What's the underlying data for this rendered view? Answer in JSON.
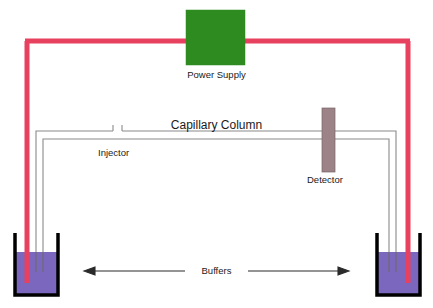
{
  "diagram": {
    "canvas": {
      "width": 433,
      "height": 308,
      "background": "#ffffff"
    },
    "labels": {
      "power_supply": "Power Supply",
      "capillary_column": "Capillary Column",
      "injector": "Injector",
      "detector": "Detector",
      "buffers": "Buffers"
    },
    "components": {
      "power_supply": {
        "name": "power-supply-box",
        "shape": "rectangle",
        "color": "#2E8B20",
        "x": 186,
        "y": 10,
        "width": 59,
        "height": 55
      },
      "detector": {
        "name": "detector-box",
        "shape": "rectangle",
        "color": "#9C8387",
        "x": 322,
        "y": 108,
        "width": 13,
        "height": 64
      },
      "left_beaker": {
        "name": "left-buffer-beaker",
        "wall_color": "#000000",
        "liquid_color": "#7B68BE",
        "x": 12,
        "y": 232,
        "width": 49,
        "height": 66,
        "liquid_top": 252
      },
      "right_beaker": {
        "name": "right-buffer-beaker",
        "wall_color": "#000000",
        "liquid_color": "#7B68BE",
        "x": 372,
        "y": 232,
        "width": 49,
        "height": 66,
        "liquid_top": 252
      },
      "electrode_wire": {
        "name": "high-voltage-wire",
        "color": "#E8415F",
        "stroke_width": 5,
        "description": "Red high-voltage circuit from left beaker electrode up over the power supply and down into the right beaker electrode"
      },
      "capillary": {
        "name": "capillary-tube",
        "color": "#8A8A8A",
        "stroke_width": 1,
        "description": "Gray double-line fused silica capillary running between both buffer beakers through injector and detector"
      },
      "arrows": {
        "name": "buffer-flow-arrows",
        "color": "#2a2a2a",
        "left_arrow": {
          "from_x": 185,
          "to_x": 90,
          "y": 271
        },
        "right_arrow": {
          "from_x": 248,
          "to_x": 343,
          "y": 271
        }
      }
    },
    "colors": {
      "power_supply_green": "#2E8B20",
      "buffer_purple": "#7B68BE",
      "detector_mauve": "#9C8387",
      "wire_red": "#E8415F",
      "capillary_gray": "#8A8A8A",
      "beaker_black": "#000000",
      "text_black": "#1a1a1a"
    }
  }
}
